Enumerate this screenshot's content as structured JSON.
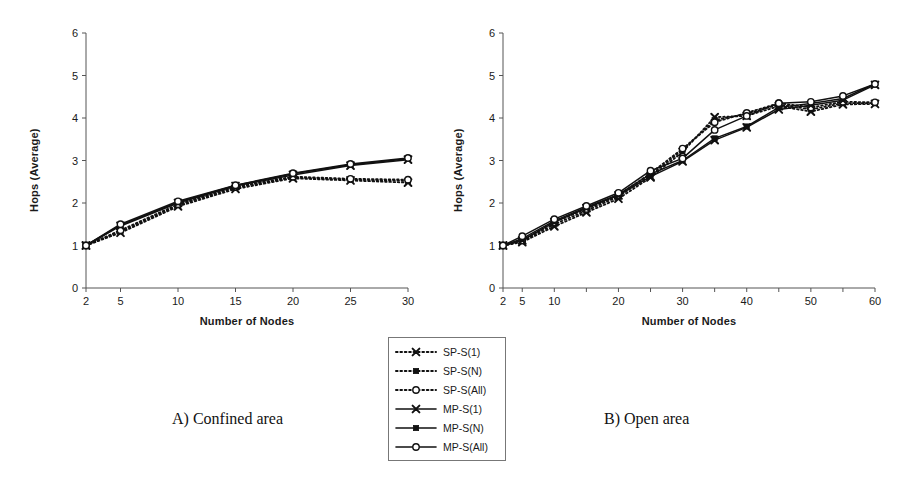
{
  "figure": {
    "background": "#ffffff",
    "axis_color": "#555555",
    "series_color": "#111111"
  },
  "legend": {
    "name": "series-legend",
    "position": "bottom-center",
    "entries": [
      {
        "label": "SP-S(1)",
        "style": "dotted",
        "marker": "x"
      },
      {
        "label": "SP-S(N)",
        "style": "dotted",
        "marker": "square-filled"
      },
      {
        "label": "SP-S(All)",
        "style": "dotted",
        "marker": "circle-open"
      },
      {
        "label": "MP-S(1)",
        "style": "solid",
        "marker": "x"
      },
      {
        "label": "MP-S(N)",
        "style": "solid",
        "marker": "square-filled"
      },
      {
        "label": "MP-S(All)",
        "style": "solid",
        "marker": "circle-open"
      }
    ]
  },
  "captions": {
    "panel_a": "A) Confined area",
    "panel_b": "B) Open area"
  },
  "chart_data": [
    {
      "id": "panel-a",
      "type": "line",
      "title": "A) Confined area",
      "xlabel": "Number of Nodes",
      "ylabel": "Hops (Average)",
      "x": [
        2,
        5,
        10,
        15,
        20,
        25,
        30
      ],
      "xtick_labels": [
        "2",
        "5",
        "10",
        "15",
        "20",
        "25",
        "30"
      ],
      "ylim": [
        0,
        6
      ],
      "ytick_labels": [
        "0",
        "1",
        "2",
        "3",
        "4",
        "5",
        "6"
      ],
      "grid": false,
      "legend_position": "external-bottom",
      "series": [
        {
          "name": "SP-S(1)",
          "style": "dotted",
          "marker": "x",
          "values": [
            1.0,
            1.3,
            1.92,
            2.33,
            2.58,
            2.53,
            2.48
          ]
        },
        {
          "name": "SP-S(N)",
          "style": "dotted",
          "marker": "square-filled",
          "values": [
            1.0,
            1.33,
            1.95,
            2.36,
            2.6,
            2.55,
            2.52
          ]
        },
        {
          "name": "SP-S(All)",
          "style": "dotted",
          "marker": "circle-open",
          "values": [
            1.0,
            1.36,
            1.97,
            2.38,
            2.62,
            2.57,
            2.55
          ]
        },
        {
          "name": "MP-S(1)",
          "style": "solid",
          "marker": "x",
          "values": [
            1.0,
            1.46,
            2.0,
            2.4,
            2.66,
            2.88,
            3.02
          ]
        },
        {
          "name": "MP-S(N)",
          "style": "solid",
          "marker": "square-filled",
          "values": [
            1.0,
            1.48,
            2.02,
            2.41,
            2.69,
            2.9,
            3.04
          ]
        },
        {
          "name": "MP-S(All)",
          "style": "solid",
          "marker": "circle-open",
          "values": [
            1.0,
            1.5,
            2.04,
            2.42,
            2.7,
            2.92,
            3.06
          ]
        }
      ]
    },
    {
      "id": "panel-b",
      "type": "line",
      "title": "B) Open area",
      "xlabel": "Number of Nodes",
      "ylabel": "Hops (Average)",
      "x": [
        2,
        5,
        10,
        15,
        20,
        25,
        30,
        35,
        40,
        45,
        50,
        55,
        60
      ],
      "xtick_labels": [
        "2",
        "5",
        "10",
        "",
        "20",
        "",
        "30",
        "",
        "40",
        "",
        "50",
        "",
        "60"
      ],
      "ylim": [
        0,
        6
      ],
      "ytick_labels": [
        "0",
        "1",
        "2",
        "3",
        "4",
        "5",
        "6"
      ],
      "grid": false,
      "legend_position": "external-bottom",
      "series": [
        {
          "name": "SP-S(1)",
          "style": "dotted",
          "marker": "x",
          "values": [
            1.0,
            1.08,
            1.45,
            1.78,
            2.1,
            2.6,
            3.2,
            4.02,
            4.05,
            4.28,
            4.15,
            4.32,
            4.33
          ]
        },
        {
          "name": "SP-S(N)",
          "style": "dotted",
          "marker": "square-filled",
          "values": [
            1.0,
            1.1,
            1.5,
            1.82,
            2.15,
            2.65,
            3.25,
            3.95,
            4.1,
            4.32,
            4.2,
            4.35,
            4.35
          ]
        },
        {
          "name": "SP-S(All)",
          "style": "dotted",
          "marker": "circle-open",
          "values": [
            1.0,
            1.12,
            1.55,
            1.86,
            2.18,
            2.7,
            3.28,
            3.9,
            4.12,
            4.35,
            4.25,
            4.38,
            4.37
          ]
        },
        {
          "name": "MP-S(1)",
          "style": "solid",
          "marker": "x",
          "values": [
            1.0,
            1.12,
            1.55,
            1.88,
            2.18,
            2.62,
            2.98,
            3.48,
            3.78,
            4.2,
            4.3,
            4.42,
            4.78
          ]
        },
        {
          "name": "MP-S(N)",
          "style": "solid",
          "marker": "square-filled",
          "values": [
            1.0,
            1.16,
            1.58,
            1.9,
            2.2,
            2.68,
            3.0,
            3.52,
            3.8,
            4.25,
            4.34,
            4.46,
            4.8
          ]
        },
        {
          "name": "MP-S(All)",
          "style": "solid",
          "marker": "circle-open",
          "values": [
            1.0,
            1.22,
            1.62,
            1.93,
            2.24,
            2.76,
            3.05,
            3.72,
            4.05,
            4.35,
            4.38,
            4.52,
            4.8
          ]
        }
      ]
    }
  ]
}
